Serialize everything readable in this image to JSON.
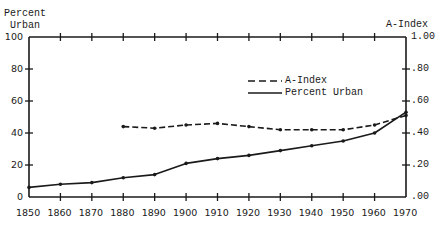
{
  "chart_data": {
    "type": "line",
    "title": "",
    "xlabel": "",
    "ylabel_left": "Percent Urban",
    "ylabel_right": "A-Index",
    "x": [
      1850,
      1860,
      1870,
      1880,
      1890,
      1900,
      1910,
      1920,
      1930,
      1940,
      1950,
      1960,
      1970
    ],
    "x_ticks": [
      "1850",
      "1860",
      "1870",
      "1880",
      "1890",
      "1900",
      "1910",
      "1920",
      "1930",
      "1940",
      "1950",
      "1960",
      "1970"
    ],
    "y_left_ticks": [
      "0",
      "20",
      "40",
      "60",
      "80",
      "100"
    ],
    "y_right_ticks": [
      ".00",
      ".20",
      ".40",
      ".60",
      ".80",
      "1.00"
    ],
    "ylim_left": [
      0,
      100
    ],
    "ylim_right": [
      0,
      1.0
    ],
    "grid": false,
    "legend_position": "upper-right-center",
    "series": [
      {
        "name": "A-Index",
        "style": "dashed",
        "axis": "right",
        "x": [
          1880,
          1890,
          1900,
          1910,
          1920,
          1930,
          1940,
          1950,
          1960,
          1970
        ],
        "values": [
          0.44,
          0.43,
          0.45,
          0.46,
          0.44,
          0.42,
          0.42,
          0.42,
          0.45,
          0.51
        ]
      },
      {
        "name": "Percent Urban",
        "style": "solid",
        "axis": "left",
        "x": [
          1850,
          1860,
          1870,
          1880,
          1890,
          1900,
          1910,
          1920,
          1930,
          1940,
          1950,
          1960,
          1970
        ],
        "values": [
          6,
          8,
          9,
          12,
          14,
          21,
          24,
          26,
          29,
          32,
          35,
          40,
          53
        ]
      }
    ]
  },
  "labels": {
    "left_axis_title_line1": "Percent",
    "left_axis_title_line2": "Urban",
    "right_axis_title": "A-Index",
    "legend_a_index": "A-Index",
    "legend_percent_urban": "Percent Urban"
  }
}
